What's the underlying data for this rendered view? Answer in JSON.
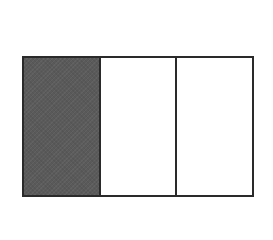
{
  "diagram": {
    "type": "fraction-model",
    "total_parts": 3,
    "shaded_parts": 1,
    "parts": [
      {
        "index": 0,
        "shaded": true
      },
      {
        "index": 1,
        "shaded": false
      },
      {
        "index": 2,
        "shaded": false
      }
    ],
    "colors": {
      "shaded_fill": "#5a5a5a",
      "unshaded_fill": "#ffffff",
      "border": "#2a2a2a",
      "background": "#ffffff"
    }
  }
}
